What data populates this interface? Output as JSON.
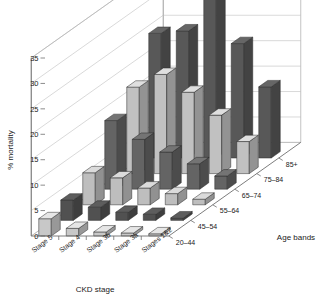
{
  "figure": {
    "y_axis_title": "% mortality",
    "x_axis_title": "CKD stage",
    "z_axis_title": "Age bands"
  },
  "chart_data": {
    "type": "bar",
    "title": "",
    "subtitle": "",
    "projection": "3d",
    "xlabel": "CKD stage",
    "ylabel": "% mortality",
    "zlabel": "Age bands",
    "grid": true,
    "legend": "none",
    "ylim": [
      0,
      35
    ],
    "ytick_labels": [
      "0",
      "5",
      "10",
      "15",
      "20",
      "25",
      "30",
      "35"
    ],
    "ytick_values": [
      0,
      5,
      10,
      15,
      20,
      25,
      30,
      35
    ],
    "categories": [
      "Stage 5",
      "Stage 4",
      "Stage 3b",
      "Stage 3a",
      "Stages 1&2"
    ],
    "depth_categories": [
      "20–44",
      "45–54",
      "55–64",
      "65–74",
      "75–84",
      "85+"
    ],
    "series": [
      {
        "name": "20–44",
        "color": "#d9d9d9",
        "values": [
          3.4,
          1.5,
          0.8,
          0.6,
          0.2
        ]
      },
      {
        "name": "45–54",
        "color": "#585858",
        "values": [
          4.0,
          2.6,
          1.6,
          1.2,
          0.5
        ]
      },
      {
        "name": "55–64",
        "color": "#cfcfcf",
        "values": [
          6.3,
          5.3,
          3.3,
          2.2,
          1.1
        ]
      },
      {
        "name": "65–74",
        "color": "#6d6d6d",
        "values": [
          13.5,
          9.8,
          7.3,
          5.0,
          2.6
        ]
      },
      {
        "name": "75–84",
        "color": "#d2d2d2",
        "values": [
          17.0,
          19.5,
          16.0,
          11.5,
          6.3
        ]
      },
      {
        "name": "85+",
        "color": "#606060",
        "values": [
          24.5,
          25.0,
          32.5,
          22.5,
          14.0
        ]
      }
    ]
  }
}
